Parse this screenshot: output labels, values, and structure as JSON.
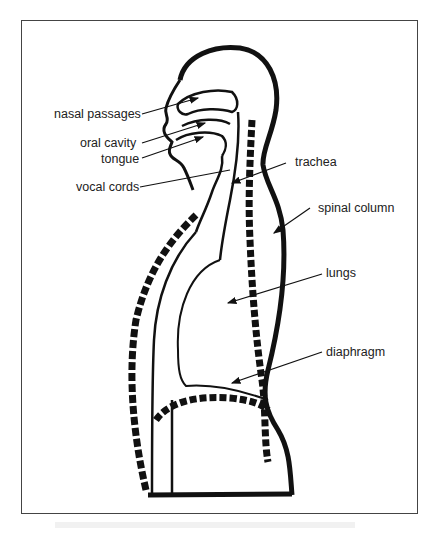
{
  "figure": {
    "labels": [
      {
        "id": "nasal-passages",
        "text": "nasal passages"
      },
      {
        "id": "oral-cavity",
        "text": "oral cavity"
      },
      {
        "id": "tongue",
        "text": "tongue"
      },
      {
        "id": "vocal-cords",
        "text": "vocal cords"
      },
      {
        "id": "trachea",
        "text": "trachea"
      },
      {
        "id": "spinal-column",
        "text": "spinal column"
      },
      {
        "id": "lungs",
        "text": "lungs"
      },
      {
        "id": "diaphragm",
        "text": "diaphragm"
      }
    ]
  }
}
